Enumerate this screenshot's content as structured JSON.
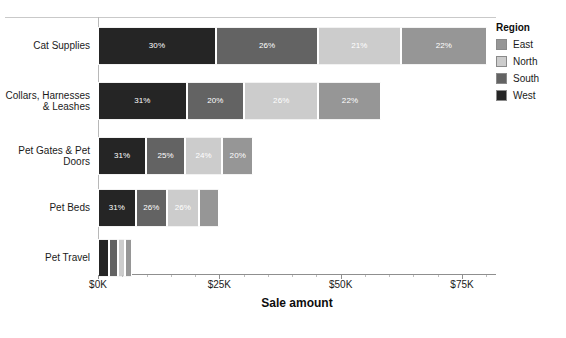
{
  "chart_data": {
    "type": "bar",
    "orientation": "horizontal",
    "stacked": true,
    "title": "",
    "xlabel": "Sale amount",
    "ylabel": "",
    "xlim": [
      0,
      82000
    ],
    "xticks": [
      0,
      25000,
      50000,
      75000
    ],
    "xtick_labels": [
      "$0K",
      "$25K",
      "$50K",
      "$75K"
    ],
    "grid": false,
    "legend_position": "right",
    "legend_title": "Region",
    "categories": [
      "Cat Supplies",
      "Collars, Harnesses & Leashes",
      "Pet Gates & Pet Doors",
      "Pet Beds",
      "Pet Travel"
    ],
    "category_totals": [
      81000,
      59000,
      32000,
      25000,
      7000
    ],
    "series": [
      {
        "name": "West",
        "color": "#252525",
        "values": [
          24300,
          18290,
          9920,
          7750,
          2200
        ],
        "percent_labels": [
          "30%",
          "31%",
          "31%",
          "31%",
          ""
        ]
      },
      {
        "name": "South",
        "color": "#636363",
        "values": [
          21060,
          11800,
          8000,
          6500,
          1900
        ],
        "percent_labels": [
          "26%",
          "20%",
          "25%",
          "26%",
          ""
        ]
      },
      {
        "name": "North",
        "color": "#cccccc",
        "values": [
          17010,
          15340,
          7680,
          6500,
          1500
        ],
        "percent_labels": [
          "21%",
          "26%",
          "24%",
          "26%",
          ""
        ]
      },
      {
        "name": "East",
        "color": "#969696",
        "values": [
          17820,
          12980,
          6400,
          4250,
          1400
        ],
        "percent_labels": [
          "22%",
          "22%",
          "20%",
          "",
          ""
        ]
      }
    ]
  },
  "legend": {
    "title": "Region",
    "items": [
      {
        "label": "East",
        "color": "#969696"
      },
      {
        "label": "North",
        "color": "#cccccc"
      },
      {
        "label": "South",
        "color": "#636363"
      },
      {
        "label": "West",
        "color": "#252525"
      }
    ]
  },
  "axis": {
    "x_title": "Sale amount",
    "x_tick_labels": [
      "$0K",
      "$25K",
      "$50K",
      "$75K"
    ]
  }
}
